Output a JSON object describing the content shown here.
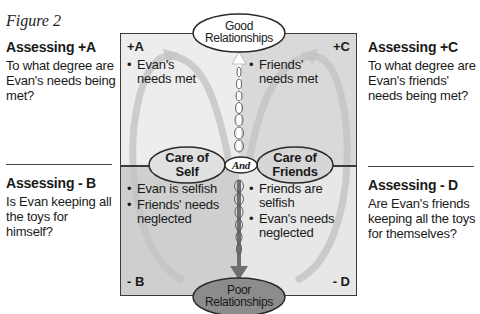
{
  "figure_label": "Figure 2",
  "side_panels": {
    "a": {
      "heading": "Assessing +A",
      "question": "To what degree are Evan's needs being met?"
    },
    "c": {
      "heading": "Assessing +C",
      "question": "To what degree are Evan's friends' needs being met?"
    },
    "b": {
      "heading": "Assessing - B",
      "question": "Is Evan keeping all the toys for himself?"
    },
    "d": {
      "heading": "Assessing - D",
      "question": "Are Evan's friends keeping all the toys for themselves?"
    }
  },
  "quadrants": {
    "a": {
      "label": "+A",
      "bullets": [
        "Evan's needs met"
      ],
      "color": "#ededed"
    },
    "c": {
      "label": "+C",
      "bullets": [
        "Friends' needs met"
      ],
      "color": "#d9d9d9"
    },
    "b": {
      "label": "- B",
      "bullets": [
        "Evan is selfish",
        "Friends' needs neglected"
      ],
      "color": "#cfcfcf"
    },
    "d": {
      "label": "- D",
      "bullets": [
        "Friends are selfish",
        "Evan's needs neglected"
      ],
      "color": "#e7e7e7"
    }
  },
  "nodes": {
    "top": {
      "line1": "Good",
      "line2": "Relationships",
      "fill": "#ffffff"
    },
    "bottom": {
      "line1": "Poor",
      "line2": "Relationships",
      "fill": "#8c8c8c"
    },
    "left": {
      "line1": "Care of",
      "line2": "Self",
      "fill": "#e0e0e0"
    },
    "right": {
      "line1": "Care of",
      "line2": "Friends",
      "fill": "#d6d6d6"
    },
    "center": {
      "label": "And",
      "fill": "#ffffff"
    }
  }
}
